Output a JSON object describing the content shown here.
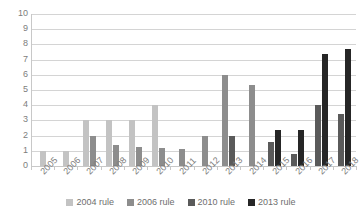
{
  "chart_data": {
    "type": "bar",
    "title": "",
    "xlabel": "",
    "ylabel": "",
    "ylim": [
      0,
      10
    ],
    "yticks": [
      0,
      1,
      2,
      3,
      4,
      5,
      6,
      7,
      8,
      9,
      10
    ],
    "grid": true,
    "legend_position": "bottom",
    "categories": [
      "2005",
      "2006",
      "2007",
      "2008",
      "2009",
      "2010",
      "2011",
      "2012",
      "2013",
      "2014",
      "2015",
      "2016",
      "2017",
      "2018"
    ],
    "series": [
      {
        "name": "2004 rule",
        "color": "#c3c3c3",
        "values": [
          1,
          1,
          3,
          3,
          3,
          4,
          0,
          0,
          0,
          0,
          0,
          0,
          0,
          0
        ]
      },
      {
        "name": "2006 rule",
        "color": "#8d8d8d",
        "values": [
          0,
          0,
          2,
          1.4,
          1.25,
          1.2,
          1.1,
          2,
          6,
          5.3,
          0,
          0,
          0,
          0
        ]
      },
      {
        "name": "2010 rule",
        "color": "#5a5a5a",
        "values": [
          0,
          0,
          0,
          0,
          0,
          0,
          0,
          0,
          2,
          0,
          1.6,
          0.8,
          4,
          3.4
        ]
      },
      {
        "name": "2013 rule",
        "color": "#262626",
        "values": [
          0,
          0,
          0,
          0,
          0,
          0,
          0,
          0,
          0,
          0,
          2.4,
          2.4,
          7.4,
          7.7
        ]
      }
    ]
  },
  "legend": {
    "items": [
      {
        "label": "2004 rule",
        "color": "#c3c3c3"
      },
      {
        "label": "2006 rule",
        "color": "#8d8d8d"
      },
      {
        "label": "2010 rule",
        "color": "#5a5a5a"
      },
      {
        "label": "2013 rule",
        "color": "#262626"
      }
    ]
  }
}
